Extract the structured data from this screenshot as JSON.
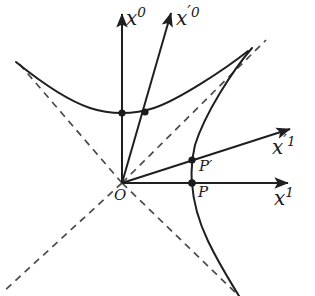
{
  "figure": {
    "kind": "geometric-diagram",
    "width": 315,
    "height": 296,
    "stroke_color": "#1f1f1f",
    "dash_color": "#4a4a4a",
    "background": "#ffffff"
  },
  "labels": {
    "x0": {
      "base": "x",
      "sup": "0",
      "prime": ""
    },
    "x0_prime": {
      "base": "x",
      "prime": "′",
      "sup": "0"
    },
    "x1": {
      "base": "x",
      "sup": "1",
      "prime": ""
    },
    "x1_prime": {
      "base": "x",
      "prime": "′",
      "sup": "1"
    },
    "origin": "O",
    "point_P": "P",
    "point_P_prime": "P′"
  },
  "label_text": {
    "x0": "x0",
    "x0_prime": "x′0",
    "x1": "x1",
    "x1_prime": "x′1",
    "origin": "O",
    "P": "P",
    "P_prime": "P′"
  },
  "geometry": {
    "origin": {
      "x": 122,
      "y": 183
    },
    "axes": [
      {
        "name": "x0",
        "from": [
          122,
          183
        ],
        "to": [
          122,
          10
        ],
        "style": "solid",
        "arrow": true
      },
      {
        "name": "x1",
        "from": [
          122,
          183
        ],
        "to": [
          293,
          183
        ],
        "style": "solid",
        "arrow": true
      },
      {
        "name": "x0-prime",
        "from": [
          122,
          183
        ],
        "to": [
          173,
          8
        ],
        "style": "solid",
        "arrow": true
      },
      {
        "name": "x1-prime",
        "from": [
          122,
          183
        ],
        "to": [
          296,
          127
        ],
        "style": "solid",
        "arrow": true
      }
    ],
    "light_cone": [
      {
        "name": "lightcone-up-right",
        "from": [
          122,
          183
        ],
        "to": [
          266,
          40
        ],
        "style": "dashed"
      },
      {
        "name": "lightcone-down-left",
        "from": [
          122,
          183
        ],
        "to": [
          4,
          291
        ],
        "style": "dashed"
      },
      {
        "name": "lightcone-up-left",
        "from": [
          122,
          183
        ],
        "to": [
          18,
          62
        ],
        "style": "dashed"
      },
      {
        "name": "lightcone-down-right",
        "from": [
          122,
          183
        ],
        "to": [
          239,
          296
        ],
        "style": "dashed"
      }
    ],
    "hyperbolae": [
      {
        "name": "timelike-hyperbola",
        "vertex": [
          122,
          113
        ],
        "semi_axis": 70,
        "branch": "upper"
      },
      {
        "name": "spacelike-hyperbola",
        "vertex": [
          192,
          183
        ],
        "semi_axis": 70,
        "branch": "right"
      }
    ],
    "points": [
      {
        "name": "origin",
        "x": 122,
        "y": 183,
        "filled": false,
        "label": "O"
      },
      {
        "name": "unit-time-point",
        "x": 122,
        "y": 113,
        "filled": true,
        "label": ""
      },
      {
        "name": "unit-time-point-primed",
        "x": 145,
        "y": 112,
        "filled": true,
        "label": ""
      },
      {
        "name": "point-P",
        "x": 192,
        "y": 183,
        "filled": true,
        "label": "P"
      },
      {
        "name": "point-P-prime",
        "x": 192,
        "y": 160,
        "filled": true,
        "label": "P′"
      }
    ]
  },
  "label_positions": {
    "x0": {
      "left": 126,
      "top": 6
    },
    "x0_prime": {
      "left": 176,
      "top": 4
    },
    "x1": {
      "left": 274,
      "top": 186
    },
    "x1_prime": {
      "left": 272,
      "top": 133
    },
    "origin": {
      "left": 114,
      "top": 190
    },
    "P": {
      "left": 198,
      "top": 186
    },
    "P_prime": {
      "left": 199,
      "top": 160
    }
  }
}
